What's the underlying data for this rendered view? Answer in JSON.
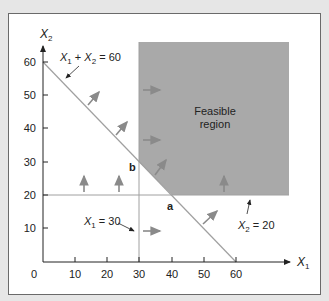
{
  "diagram": {
    "axes": {
      "x_label": "X",
      "x_sub": "1",
      "y_label": "X",
      "y_sub": "2",
      "x_ticks": [
        "0",
        "10",
        "20",
        "30",
        "40",
        "50",
        "60"
      ],
      "y_ticks": [
        "10",
        "20",
        "30",
        "40",
        "50",
        "60"
      ]
    },
    "constraints": {
      "c1_label": {
        "v1": "X",
        "s1": "1",
        "plus": " + ",
        "v2": "X",
        "s2": "2",
        "rhs": " = 60"
      },
      "c2_label": {
        "v": "X",
        "s": "1",
        "rhs": " = 30"
      },
      "c3_label": {
        "v": "X",
        "s": "2",
        "rhs": " = 20"
      }
    },
    "region_label_line1": "Feasible",
    "region_label_line2": "region",
    "point_a": "a",
    "point_b": "b",
    "colors": {
      "background": "#e6e6e6",
      "region_fill": "#a9a9a9",
      "line": "#9a9a9a",
      "arrow": "#8a8a8a",
      "text": "#222222"
    }
  }
}
